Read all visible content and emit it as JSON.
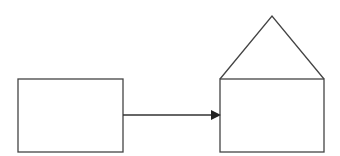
{
  "diagram": {
    "stroke_color": "#444444",
    "background": "#ffffff",
    "nodes": [
      {
        "id": "box",
        "shape": "rectangle",
        "x": 18,
        "y": 79,
        "w": 105,
        "h": 73
      },
      {
        "id": "house",
        "shape": "house",
        "x": 220,
        "y": 79,
        "w": 104,
        "h": 73,
        "roof_apex": [
          272,
          16
        ]
      }
    ],
    "edges": [
      {
        "from": "box",
        "to": "house",
        "type": "arrow",
        "y": 115
      }
    ]
  }
}
